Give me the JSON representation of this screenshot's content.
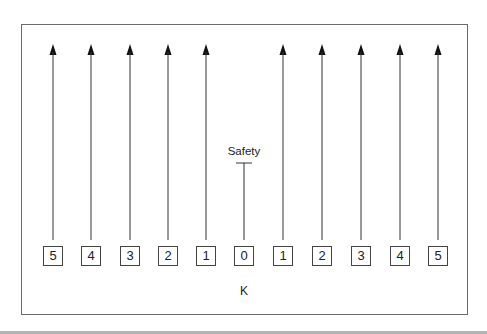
{
  "diagram": {
    "safety_label": "Safety",
    "axis_label": "K",
    "positions": [
      {
        "label": "5",
        "x": 53,
        "arrow": true
      },
      {
        "label": "4",
        "x": 91,
        "arrow": true
      },
      {
        "label": "3",
        "x": 130,
        "arrow": true
      },
      {
        "label": "2",
        "x": 168,
        "arrow": true
      },
      {
        "label": "1",
        "x": 206,
        "arrow": true
      },
      {
        "label": "0",
        "x": 244,
        "arrow": false
      },
      {
        "label": "1",
        "x": 283,
        "arrow": true
      },
      {
        "label": "2",
        "x": 322,
        "arrow": true
      },
      {
        "label": "3",
        "x": 361,
        "arrow": true
      },
      {
        "label": "4",
        "x": 400,
        "arrow": true
      },
      {
        "label": "5",
        "x": 438,
        "arrow": true
      }
    ],
    "colors": {
      "line": "#333333",
      "frame": "#6a6a6a"
    }
  }
}
